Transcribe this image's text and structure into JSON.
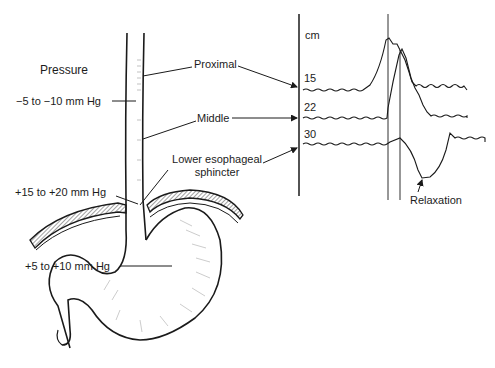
{
  "diagram": {
    "title_label": "Pressure",
    "pressure_labels": {
      "esophagus_body": "−5 to  −10 mm Hg",
      "les": "+15 to  +20 mm Hg",
      "stomach": "+5 to  +10 mm Hg"
    },
    "region_labels": {
      "proximal": "Proximal",
      "middle": "Middle",
      "les_line1": "Lower esophageal",
      "les_line2": "sphincter"
    },
    "manometry": {
      "axis_unit": "cm",
      "channels": [
        {
          "depth": "15",
          "label": "15",
          "region": "Proximal"
        },
        {
          "depth": "22",
          "label": "22",
          "region": "Middle"
        },
        {
          "depth": "30",
          "label": "30",
          "region": "Lower esophageal sphincter"
        }
      ],
      "annotation": "Relaxation"
    },
    "colors": {
      "ink": "#1a1a1a",
      "hatch": "#555555",
      "background": "#ffffff"
    }
  }
}
